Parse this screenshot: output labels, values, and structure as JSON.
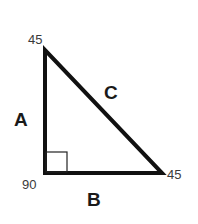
{
  "diagram": {
    "type": "right-triangle",
    "title": "",
    "colors": {
      "stroke": "#111111",
      "angle_text": "#3a3a3a",
      "side_text": "#1a1a1a",
      "background": "#ffffff"
    },
    "vertices": {
      "top": {
        "x": 45,
        "y": 50,
        "angle_label": "45"
      },
      "bottom_left": {
        "x": 45,
        "y": 173,
        "angle_label": "90"
      },
      "bottom_right": {
        "x": 162,
        "y": 173,
        "angle_label": "45"
      }
    },
    "sides": {
      "A": {
        "label": "A",
        "description": "vertical leg"
      },
      "B": {
        "label": "B",
        "description": "horizontal leg"
      },
      "C": {
        "label": "C",
        "description": "hypotenuse"
      }
    },
    "right_angle_marker": {
      "size": 22
    }
  }
}
